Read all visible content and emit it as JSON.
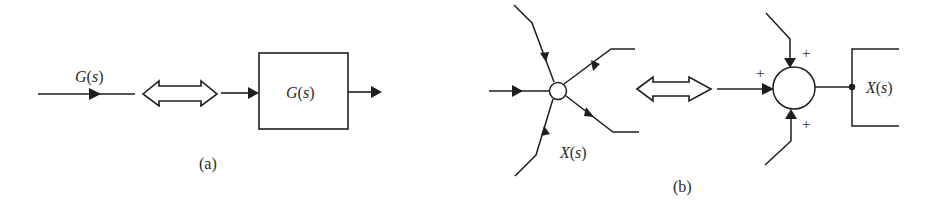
{
  "figure": {
    "part_a": {
      "caption": "(a)",
      "branch_label_func": "G",
      "branch_label_arg": "s",
      "block_label_func": "G",
      "block_label_arg": "s",
      "equivalence_symbol": "double-arrow"
    },
    "part_b": {
      "caption": "(b)",
      "node_label_func": "X",
      "node_label_arg": "s",
      "output_label_func": "X",
      "output_label_arg": "s",
      "summing_signs": [
        "+",
        "+",
        "+"
      ],
      "equivalence_symbol": "double-arrow"
    },
    "colors": {
      "ink": "#1e1e1e",
      "background": "#ffffff"
    }
  }
}
